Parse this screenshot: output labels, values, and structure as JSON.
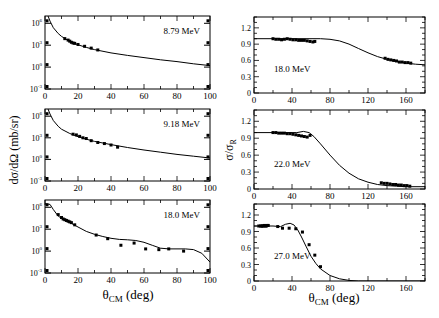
{
  "figure": {
    "left_column_ylabel": "dσ/dΩ (mb/sr)",
    "right_column_ylabel_main": "σ/σ",
    "right_column_ylabel_sub": "R",
    "xlabel_main": "θ",
    "xlabel_sub": "CM",
    "xlabel_unit": " (deg)"
  },
  "chart_data": [
    {
      "type": "scatter",
      "title": "8.79 MeV",
      "column": "left",
      "xlabel": "θCM (deg)",
      "ylabel": "dσ/dΩ (mb/sr)",
      "yscale": "log",
      "xlim": [
        0,
        100
      ],
      "ylim_log10": [
        -3,
        7
      ],
      "xticks": [
        0,
        20,
        40,
        60,
        80,
        100
      ],
      "yticks": [
        {
          "exp": 6,
          "label": "10",
          "sup": "6"
        },
        {
          "exp": 3,
          "label": "10",
          "sup": "3"
        },
        {
          "exp": 0,
          "label": "10",
          "sup": "0"
        },
        {
          "exp": -3,
          "label": "10",
          "sup": "-3"
        }
      ],
      "curve_log10": [
        [
          1,
          7.5
        ],
        [
          3,
          6.3
        ],
        [
          5,
          5.4
        ],
        [
          8,
          4.6
        ],
        [
          10,
          4.2
        ],
        [
          15,
          3.5
        ],
        [
          20,
          3.05
        ],
        [
          25,
          2.7
        ],
        [
          30,
          2.4
        ],
        [
          40,
          1.95
        ],
        [
          50,
          1.6
        ],
        [
          60,
          1.3
        ],
        [
          70,
          1.0
        ],
        [
          80,
          0.75
        ],
        [
          90,
          0.45
        ],
        [
          100,
          0.2
        ]
      ],
      "points_log10": [
        [
          12,
          3.9
        ],
        [
          14,
          3.7
        ],
        [
          15,
          3.55
        ],
        [
          16,
          3.4
        ],
        [
          17,
          3.3
        ],
        [
          18,
          3.25
        ],
        [
          20,
          3.1
        ],
        [
          24,
          2.85
        ],
        [
          28,
          2.6
        ],
        [
          32,
          2.35
        ]
      ]
    },
    {
      "type": "scatter",
      "title": "9.18 MeV",
      "column": "left",
      "xlabel": "θCM (deg)",
      "ylabel": "dσ/dΩ (mb/sr)",
      "yscale": "log",
      "xlim": [
        0,
        100
      ],
      "ylim_log10": [
        -3,
        7
      ],
      "xticks": [
        0,
        20,
        40,
        60,
        80,
        100
      ],
      "yticks": [
        {
          "exp": 6,
          "label": "10",
          "sup": "6"
        },
        {
          "exp": 3,
          "label": "10",
          "sup": "3"
        },
        {
          "exp": 0,
          "label": "10",
          "sup": "0"
        },
        {
          "exp": -3,
          "label": "10",
          "sup": "-3"
        }
      ],
      "curve_log10": [
        [
          1,
          7.5
        ],
        [
          3,
          6.3
        ],
        [
          5,
          5.4
        ],
        [
          8,
          4.6
        ],
        [
          10,
          4.2
        ],
        [
          15,
          3.6
        ],
        [
          20,
          3.15
        ],
        [
          25,
          2.8
        ],
        [
          30,
          2.5
        ],
        [
          40,
          2.05
        ],
        [
          50,
          1.65
        ],
        [
          60,
          1.3
        ],
        [
          70,
          1.0
        ],
        [
          80,
          0.7
        ],
        [
          90,
          0.45
        ],
        [
          100,
          0.2
        ]
      ],
      "points_log10": [
        [
          17,
          3.5
        ],
        [
          19,
          3.4
        ],
        [
          21,
          3.2
        ],
        [
          23,
          3.0
        ],
        [
          25,
          2.9
        ],
        [
          28,
          2.6
        ],
        [
          32,
          2.35
        ],
        [
          36,
          2.2
        ],
        [
          40,
          2.0
        ],
        [
          44,
          1.7
        ]
      ]
    },
    {
      "type": "scatter",
      "title": "18.0 MeV",
      "column": "left",
      "xlabel": "θCM (deg)",
      "ylabel": "dσ/dΩ (mb/sr)",
      "yscale": "log",
      "xlim": [
        0,
        100
      ],
      "ylim_log10": [
        -3,
        7
      ],
      "xticks": [
        0,
        20,
        40,
        60,
        80,
        100
      ],
      "yticks": [
        {
          "exp": 6,
          "label": "10",
          "sup": "6"
        },
        {
          "exp": 3,
          "label": "10",
          "sup": "3"
        },
        {
          "exp": 0,
          "label": "10",
          "sup": "0"
        },
        {
          "exp": -3,
          "label": "10",
          "sup": "-3"
        }
      ],
      "curve_log10": [
        [
          0,
          6.5
        ],
        [
          3,
          6.4
        ],
        [
          5,
          5.7
        ],
        [
          8,
          4.8
        ],
        [
          12,
          4.2
        ],
        [
          16,
          3.8
        ],
        [
          20,
          3.3
        ],
        [
          25,
          2.7
        ],
        [
          30,
          2.3
        ],
        [
          35,
          2.0
        ],
        [
          40,
          1.75
        ],
        [
          45,
          1.6
        ],
        [
          50,
          1.55
        ],
        [
          55,
          1.45
        ],
        [
          60,
          1.2
        ],
        [
          65,
          0.8
        ],
        [
          70,
          0.4
        ],
        [
          75,
          0.3
        ],
        [
          80,
          0.3
        ],
        [
          85,
          0.3
        ],
        [
          90,
          0.2
        ],
        [
          95,
          -0.3
        ],
        [
          100,
          -1.5
        ]
      ],
      "points_log10": [
        [
          8,
          5.0
        ],
        [
          10,
          4.6
        ],
        [
          11,
          4.4
        ],
        [
          12,
          4.3
        ],
        [
          13,
          4.2
        ],
        [
          14,
          4.1
        ],
        [
          15,
          4.0
        ],
        [
          16,
          3.9
        ],
        [
          18,
          3.6
        ],
        [
          31,
          2.2
        ],
        [
          38,
          1.7
        ],
        [
          46,
          0.8
        ],
        [
          54,
          1.1
        ],
        [
          61,
          0.3
        ],
        [
          69,
          0.2
        ],
        [
          75,
          0.3
        ],
        [
          84,
          0.0
        ]
      ]
    },
    {
      "type": "scatter",
      "title": "18.0 MeV",
      "column": "right",
      "xlabel": "θCM (deg)",
      "ylabel": "σ/σR",
      "xlim": [
        0,
        180
      ],
      "ylim": [
        0,
        1.4
      ],
      "xticks": [
        0,
        40,
        80,
        120,
        160
      ],
      "yticks": [
        0,
        0.3,
        0.6,
        0.9,
        1.2
      ],
      "ytick_labels": [
        "0",
        "0.3",
        "0.6",
        "0.9",
        "1.2"
      ],
      "curve": [
        [
          0,
          1.0
        ],
        [
          40,
          1.0
        ],
        [
          70,
          1.0
        ],
        [
          80,
          0.99
        ],
        [
          90,
          0.96
        ],
        [
          100,
          0.9
        ],
        [
          110,
          0.82
        ],
        [
          120,
          0.74
        ],
        [
          130,
          0.67
        ],
        [
          140,
          0.62
        ],
        [
          150,
          0.58
        ],
        [
          160,
          0.55
        ],
        [
          170,
          0.53
        ],
        [
          180,
          0.52
        ]
      ],
      "points": [
        [
          20,
          1.0
        ],
        [
          23,
          0.99
        ],
        [
          26,
          0.99
        ],
        [
          29,
          0.98
        ],
        [
          32,
          0.99
        ],
        [
          35,
          1.0
        ],
        [
          38,
          0.99
        ],
        [
          41,
          0.98
        ],
        [
          44,
          0.98
        ],
        [
          47,
          0.97
        ],
        [
          50,
          0.97
        ],
        [
          53,
          0.97
        ],
        [
          56,
          0.96
        ],
        [
          59,
          0.95
        ],
        [
          62,
          0.94
        ],
        [
          64,
          0.95
        ],
        [
          138,
          0.64
        ],
        [
          141,
          0.62
        ],
        [
          144,
          0.61
        ],
        [
          147,
          0.6
        ],
        [
          150,
          0.59
        ],
        [
          153,
          0.57
        ],
        [
          156,
          0.57
        ],
        [
          159,
          0.56
        ],
        [
          162,
          0.56
        ],
        [
          165,
          0.55
        ]
      ]
    },
    {
      "type": "scatter",
      "title": "22.0 MeV",
      "column": "right",
      "xlabel": "θCM (deg)",
      "ylabel": "σ/σR",
      "xlim": [
        0,
        180
      ],
      "ylim": [
        0,
        1.4
      ],
      "xticks": [
        0,
        40,
        80,
        120,
        160
      ],
      "yticks": [
        0,
        0.3,
        0.6,
        0.9,
        1.2
      ],
      "ytick_labels": [
        "0",
        "0.3",
        "0.6",
        "0.9",
        "1.2"
      ],
      "curve": [
        [
          0,
          1.0
        ],
        [
          30,
          1.0
        ],
        [
          45,
          1.0
        ],
        [
          52,
          1.02
        ],
        [
          58,
          1.0
        ],
        [
          63,
          0.93
        ],
        [
          70,
          0.8
        ],
        [
          80,
          0.6
        ],
        [
          90,
          0.42
        ],
        [
          100,
          0.28
        ],
        [
          110,
          0.18
        ],
        [
          120,
          0.12
        ],
        [
          130,
          0.08
        ],
        [
          140,
          0.06
        ],
        [
          150,
          0.05
        ],
        [
          160,
          0.04
        ],
        [
          180,
          0.04
        ]
      ],
      "points": [
        [
          20,
          1.0
        ],
        [
          23,
          1.0
        ],
        [
          26,
          0.99
        ],
        [
          29,
          0.99
        ],
        [
          32,
          0.99
        ],
        [
          35,
          0.98
        ],
        [
          38,
          0.98
        ],
        [
          41,
          0.97
        ],
        [
          44,
          0.96
        ],
        [
          47,
          0.95
        ],
        [
          50,
          0.94
        ],
        [
          53,
          0.93
        ],
        [
          56,
          0.92
        ],
        [
          59,
          0.95
        ],
        [
          134,
          0.11
        ],
        [
          137,
          0.1
        ],
        [
          140,
          0.1
        ],
        [
          143,
          0.09
        ],
        [
          146,
          0.08
        ],
        [
          149,
          0.08
        ],
        [
          152,
          0.07
        ],
        [
          155,
          0.07
        ],
        [
          158,
          0.06
        ],
        [
          161,
          0.06
        ],
        [
          164,
          0.05
        ]
      ]
    },
    {
      "type": "scatter",
      "title": "27.0 MeV",
      "column": "right",
      "xlabel": "θCM (deg)",
      "ylabel": "σ/σR",
      "xlim": [
        0,
        180
      ],
      "ylim": [
        0,
        1.4
      ],
      "xticks": [
        0,
        40,
        80,
        120,
        160
      ],
      "yticks": [
        0,
        0.3,
        0.6,
        0.9,
        1.2
      ],
      "ytick_labels": [
        "0",
        "0.3",
        "0.6",
        "0.9",
        "1.2"
      ],
      "curve": [
        [
          0,
          1.0
        ],
        [
          20,
          1.0
        ],
        [
          28,
          0.99
        ],
        [
          33,
          1.03
        ],
        [
          38,
          1.05
        ],
        [
          42,
          1.02
        ],
        [
          46,
          0.93
        ],
        [
          50,
          0.8
        ],
        [
          55,
          0.62
        ],
        [
          60,
          0.45
        ],
        [
          65,
          0.32
        ],
        [
          70,
          0.22
        ],
        [
          80,
          0.1
        ],
        [
          90,
          0.04
        ],
        [
          100,
          0.01
        ],
        [
          110,
          0.0
        ],
        [
          120,
          0.0
        ],
        [
          180,
          0.0
        ]
      ],
      "points": [
        [
          5,
          1.0
        ],
        [
          7,
          1.0
        ],
        [
          8,
          1.0
        ],
        [
          9,
          1.0
        ],
        [
          10,
          1.0
        ],
        [
          11,
          1.01
        ],
        [
          12,
          1.0
        ],
        [
          13,
          1.0
        ],
        [
          14,
          1.01
        ],
        [
          15,
          1.01
        ],
        [
          25,
          0.99
        ],
        [
          30,
          0.96
        ],
        [
          37,
          0.96
        ],
        [
          44,
          0.95
        ],
        [
          51,
          0.89
        ],
        [
          58,
          0.66
        ],
        [
          64,
          0.47
        ],
        [
          70,
          0.26
        ]
      ]
    }
  ]
}
